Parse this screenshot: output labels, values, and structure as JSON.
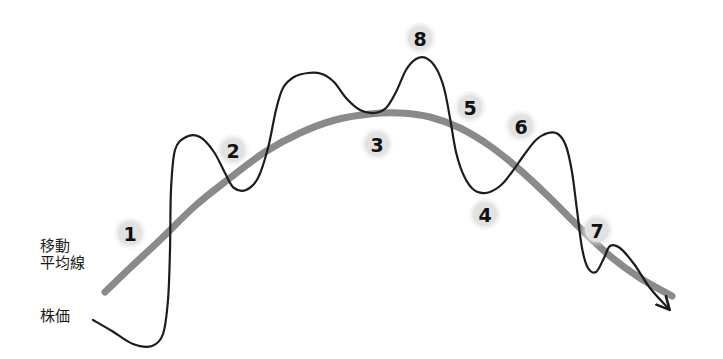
{
  "figure": {
    "kind": "diagram",
    "background": "#ffffff",
    "width": 723,
    "height": 359
  },
  "labels": {
    "moving_average_line1": "移動",
    "moving_average_line2": "平均線",
    "stock_price": "株価"
  },
  "colors": {
    "price_line": "#1c1c1c",
    "moving_average": "#8a8a8a",
    "marker_fill": "#e2e2e2",
    "marker_text": "#111111",
    "label_text": "#1a1a1a"
  },
  "chart_data": {
    "type": "line",
    "title": "",
    "xlabel": "",
    "ylabel": "",
    "grid": false,
    "legend": "inline-left",
    "series": [
      {
        "name": "株価",
        "color": "#1c1c1c",
        "style": "solid",
        "width": 2.2,
        "arrow_end": true,
        "points": [
          [
            93,
            320
          ],
          [
            112,
            331
          ],
          [
            133,
            344
          ],
          [
            152,
            346
          ],
          [
            163,
            334
          ],
          [
            168,
            300
          ],
          [
            170,
            250
          ],
          [
            171,
            190
          ],
          [
            175,
            150
          ],
          [
            186,
            137
          ],
          [
            200,
            137
          ],
          [
            214,
            152
          ],
          [
            226,
            175
          ],
          [
            234,
            188
          ],
          [
            246,
            190
          ],
          [
            258,
            178
          ],
          [
            268,
            148
          ],
          [
            276,
            110
          ],
          [
            283,
            88
          ],
          [
            294,
            77
          ],
          [
            308,
            73
          ],
          [
            322,
            74
          ],
          [
            334,
            82
          ],
          [
            346,
            98
          ],
          [
            360,
            110
          ],
          [
            374,
            113
          ],
          [
            386,
            108
          ],
          [
            396,
            92
          ],
          [
            406,
            70
          ],
          [
            416,
            59
          ],
          [
            426,
            58
          ],
          [
            436,
            68
          ],
          [
            444,
            88
          ],
          [
            450,
            118
          ],
          [
            456,
            152
          ],
          [
            464,
            176
          ],
          [
            474,
            190
          ],
          [
            486,
            193
          ],
          [
            500,
            186
          ],
          [
            512,
            172
          ],
          [
            524,
            155
          ],
          [
            536,
            140
          ],
          [
            548,
            133
          ],
          [
            558,
            134
          ],
          [
            566,
            146
          ],
          [
            572,
            172
          ],
          [
            577,
            210
          ],
          [
            582,
            248
          ],
          [
            588,
            268
          ],
          [
            596,
            272
          ],
          [
            604,
            258
          ],
          [
            610,
            246
          ],
          [
            620,
            248
          ],
          [
            634,
            264
          ],
          [
            650,
            288
          ],
          [
            668,
            308
          ]
        ]
      },
      {
        "name": "移動平均線",
        "color": "#8a8a8a",
        "style": "solid",
        "width": 7,
        "arrow_end": false,
        "points": [
          [
            105,
            292
          ],
          [
            130,
            268
          ],
          [
            160,
            240
          ],
          [
            195,
            206
          ],
          [
            230,
            178
          ],
          [
            265,
            152
          ],
          [
            300,
            133
          ],
          [
            335,
            120
          ],
          [
            370,
            114
          ],
          [
            400,
            113
          ],
          [
            430,
            117
          ],
          [
            460,
            128
          ],
          [
            490,
            146
          ],
          [
            520,
            170
          ],
          [
            550,
            198
          ],
          [
            580,
            228
          ],
          [
            610,
            256
          ],
          [
            640,
            278
          ],
          [
            672,
            296
          ]
        ]
      }
    ],
    "annotations": [
      {
        "label": "1",
        "x": 130,
        "y": 233
      },
      {
        "label": "2",
        "x": 233,
        "y": 150
      },
      {
        "label": "3",
        "x": 377,
        "y": 144
      },
      {
        "label": "4",
        "x": 485,
        "y": 214
      },
      {
        "label": "5",
        "x": 470,
        "y": 107
      },
      {
        "label": "6",
        "x": 521,
        "y": 126
      },
      {
        "label": "7",
        "x": 597,
        "y": 230
      },
      {
        "label": "8",
        "x": 420,
        "y": 38
      }
    ],
    "annotation_radius": 14
  }
}
